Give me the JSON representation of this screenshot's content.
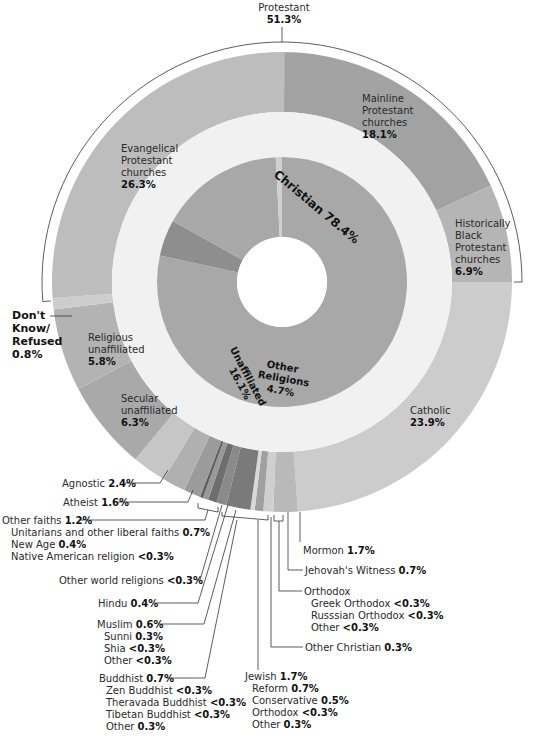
{
  "chart_data": {
    "type": "pie",
    "subtype": "nested-donut",
    "title": "",
    "center": [
      282,
      282
    ],
    "colors": {
      "inner_ring": "#a8a8a8",
      "inner_other": "#8e8e8e",
      "band": "#f1f1f1",
      "evangelical": "#bdbdbd",
      "mainline": "#a2a2a2",
      "black_protestant": "#b5b5b5",
      "catholic": "#cccccc",
      "unaffiliated_religious": "#b3b3b3",
      "unaffiliated_secular": "#a9a9a9",
      "agnostic": "#c6c6c6",
      "atheist": "#b0b0b0",
      "dark_slices": "#777777",
      "line": "#333333"
    },
    "inner_ring": [
      {
        "name": "Christian",
        "value": 78.4,
        "label": "Christian 78.4%"
      },
      {
        "name": "Other Religions",
        "value": 4.7,
        "label": "Other Religions 4.7%"
      },
      {
        "name": "Unaffiliated",
        "value": 16.1,
        "label": "Unaffiliated 16.1%"
      },
      {
        "name": "Don't Know/Refused",
        "value": 0.8,
        "label": "Don't Know/Refused 0.8%"
      }
    ],
    "outer_ring": [
      {
        "name": "Mainline Protestant churches",
        "value": 18.1,
        "group": "Protestant"
      },
      {
        "name": "Historically Black Protestant churches",
        "value": 6.9,
        "group": "Protestant"
      },
      {
        "name": "Catholic",
        "value": 23.9,
        "group": "Christian"
      },
      {
        "name": "Mormon",
        "value": 1.7,
        "group": "Christian"
      },
      {
        "name": "Jehovah's Witness",
        "value": 0.7,
        "group": "Christian"
      },
      {
        "name": "Orthodox",
        "value": 0.6,
        "group": "Christian"
      },
      {
        "name": "Other Christian",
        "value": 0.3,
        "group": "Christian"
      },
      {
        "name": "Jewish",
        "value": 1.7,
        "group": "Other Religions"
      },
      {
        "name": "Buddhist",
        "value": 0.7,
        "group": "Other Religions"
      },
      {
        "name": "Muslim",
        "value": 0.6,
        "group": "Other Religions"
      },
      {
        "name": "Hindu",
        "value": 0.4,
        "group": "Other Religions"
      },
      {
        "name": "Other world religions",
        "value": 0.2,
        "group": "Other Religions"
      },
      {
        "name": "Other faiths",
        "value": 1.2,
        "group": "Other Religions"
      },
      {
        "name": "Atheist",
        "value": 1.6,
        "group": "Unaffiliated"
      },
      {
        "name": "Agnostic",
        "value": 2.4,
        "group": "Unaffiliated"
      },
      {
        "name": "Secular unaffiliated",
        "value": 6.3,
        "group": "Unaffiliated"
      },
      {
        "name": "Religious unaffiliated",
        "value": 5.8,
        "group": "Unaffiliated"
      },
      {
        "name": "Don't Know/Refused",
        "value": 0.8,
        "group": "Don't Know/Refused"
      },
      {
        "name": "Evangelical Protestant churches",
        "value": 26.3,
        "group": "Protestant"
      }
    ],
    "bracket": {
      "name": "Protestant",
      "value": 51.3
    }
  },
  "labels": {
    "protestant": {
      "name": "Protestant",
      "value": "51.3%"
    },
    "mainline": {
      "l1": "Mainline",
      "l2": "Protestant",
      "l3": "churches",
      "value": "18.1%"
    },
    "evangelical": {
      "l1": "Evangelical",
      "l2": "Protestant",
      "l3": "churches",
      "value": "26.3%"
    },
    "black": {
      "l1": "Historically",
      "l2": "Black",
      "l3": "Protestant",
      "l4": "churches",
      "value": "6.9%"
    },
    "christian": "Christian 78.4%",
    "unaffiliated": {
      "name": "Unaffiliated",
      "value": "16.1%"
    },
    "other_religions": {
      "l1": "Other",
      "l2": "Religions",
      "value": "4.7%"
    },
    "dontknow": {
      "l1": "Don't",
      "l2": "Know/",
      "l3": "Refused",
      "value": "0.8%"
    },
    "religious_unaff": {
      "l1": "Religious",
      "l2": "unaffiliated",
      "value": "5.8%"
    },
    "secular_unaff": {
      "l1": "Secular",
      "l2": "unaffiliated",
      "value": "6.3%"
    },
    "catholic": {
      "name": "Catholic",
      "value": "23.9%"
    },
    "agnostic": {
      "name": "Agnostic",
      "value": "2.4%"
    },
    "atheist": {
      "name": "Atheist",
      "value": "1.6%"
    },
    "other_faiths": {
      "name": "Other faiths",
      "value": "1.2%",
      "subs": [
        {
          "name": "Unitarians and other liberal faiths",
          "value": "0.7%"
        },
        {
          "name": "New Age",
          "value": "0.4%"
        },
        {
          "name": "Native American religion",
          "value": "<0.3%"
        }
      ]
    },
    "other_world": {
      "name": "Other world religions",
      "value": "<0.3%"
    },
    "hindu": {
      "name": "Hindu",
      "value": "0.4%"
    },
    "muslim": {
      "name": "Muslim",
      "value": "0.6%",
      "subs": [
        {
          "name": "Sunni",
          "value": "0.3%"
        },
        {
          "name": "Shia",
          "value": "<0.3%"
        },
        {
          "name": "Other",
          "value": "<0.3%"
        }
      ]
    },
    "buddhist": {
      "name": "Buddhist",
      "value": "0.7%",
      "subs": [
        {
          "name": "Zen Buddhist",
          "value": "<0.3%"
        },
        {
          "name": "Theravada Buddhist",
          "value": "<0.3%"
        },
        {
          "name": "Tibetan Buddhist",
          "value": "<0.3%"
        },
        {
          "name": "Other",
          "value": "0.3%"
        }
      ]
    },
    "jewish": {
      "name": "Jewish",
      "value": "1.7%",
      "subs": [
        {
          "name": "Reform",
          "value": "0.7%"
        },
        {
          "name": "Conservative",
          "value": "0.5%"
        },
        {
          "name": "Orthodox",
          "value": "<0.3%"
        },
        {
          "name": "Other",
          "value": "0.3%"
        }
      ]
    },
    "mormon": {
      "name": "Mormon",
      "value": "1.7%"
    },
    "jehovah": {
      "name": "Jehovah's Witness",
      "value": "0.7%"
    },
    "orthodox": {
      "name": "Orthodox",
      "subs": [
        {
          "name": "Greek Orthodox",
          "value": "<0.3%"
        },
        {
          "name": "Russsian Orthodox",
          "value": "<0.3%"
        },
        {
          "name": "Other",
          "value": "<0.3%"
        }
      ]
    },
    "other_christian": {
      "name": "Other Christian",
      "value": "0.3%"
    }
  }
}
